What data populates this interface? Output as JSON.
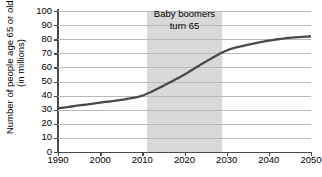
{
  "chart_data": {
    "type": "line",
    "title": "",
    "xlabel": "",
    "ylabel_line1": "Number of people age 65 or older",
    "ylabel_line2": "(in millions)",
    "xlim": [
      1990,
      2050
    ],
    "ylim": [
      0,
      100
    ],
    "grid": true,
    "legend": "none",
    "x_ticks": [
      "1990",
      "2000",
      "2010",
      "2020",
      "2030",
      "2040",
      "2050"
    ],
    "y_ticks": [
      "100",
      "90",
      "80",
      "70",
      "60",
      "50",
      "40",
      "30",
      "20",
      "10",
      "0"
    ],
    "series": [
      {
        "name": "People age 65 or older",
        "color": "#4a4a4a",
        "x": [
          1990,
          1995,
          2000,
          2005,
          2010,
          2015,
          2020,
          2025,
          2030,
          2035,
          2040,
          2045,
          2050
        ],
        "values": [
          31,
          33,
          35,
          37,
          40,
          47,
          55,
          64,
          72,
          76,
          79,
          81,
          82
        ]
      }
    ],
    "annotations": [
      {
        "name": "baby-boomers-band",
        "label_line1": "Baby boomers",
        "label_line2": "turn 65",
        "x_start": 2011,
        "x_end": 2029,
        "color": "#d9d9d9"
      }
    ]
  }
}
